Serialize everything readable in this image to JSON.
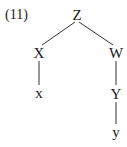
{
  "example_number": "(11)",
  "tree": {
    "root": "Z",
    "nodes": [
      {
        "id": "Z",
        "label": "Z",
        "x": 77,
        "y": 15
      },
      {
        "id": "X",
        "label": "X",
        "x": 39,
        "y": 53
      },
      {
        "id": "W",
        "label": "W",
        "x": 116,
        "y": 53
      },
      {
        "id": "x",
        "label": "x",
        "x": 39,
        "y": 94
      },
      {
        "id": "Y",
        "label": "Y",
        "x": 116,
        "y": 94
      },
      {
        "id": "y",
        "label": "y",
        "x": 116,
        "y": 133
      }
    ],
    "edges": [
      [
        "Z",
        "X"
      ],
      [
        "Z",
        "W"
      ],
      [
        "X",
        "x"
      ],
      [
        "W",
        "Y"
      ],
      [
        "Y",
        "y"
      ]
    ]
  },
  "colors": {
    "ink": "#1a1a1a",
    "edge": "#333333",
    "background": "#ffffff"
  }
}
